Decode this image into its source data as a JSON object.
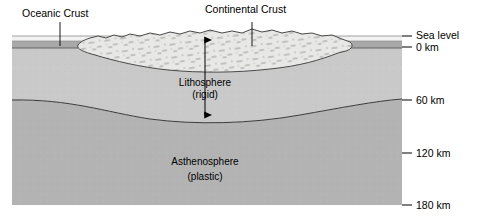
{
  "diagram": {
    "labels": {
      "oceanic_crust": "Oceanic Crust",
      "continental_crust": "Continental Crust",
      "lithosphere": "Lithosphere",
      "lithosphere_sub": "(rigid)",
      "asthenosphere": "Asthenosphere",
      "asthenosphere_sub": "(plastic)"
    },
    "depth_scale": [
      {
        "label": "Sea level",
        "depth_km": null,
        "y": 36
      },
      {
        "label": "0 km",
        "depth_km": 0,
        "y": 47
      },
      {
        "label": "60 km",
        "depth_km": 60,
        "y": 100
      },
      {
        "label": "120 km",
        "depth_km": 120,
        "y": 153
      },
      {
        "label": "180 km",
        "depth_km": 180,
        "y": 205
      }
    ],
    "colors": {
      "lithosphere": "#c9c9c9",
      "asthenosphere": "#b3b3b3",
      "oceanic_crust": "#a8a8a8",
      "continental_crust": "#e8e8e6",
      "sea_water": "#f2f2f2",
      "outline": "#333333",
      "text": "#000000",
      "page": "#ffffff"
    },
    "annotations": {
      "depth_arrow": "double-headed arrow from crust top to lithosphere base"
    }
  }
}
